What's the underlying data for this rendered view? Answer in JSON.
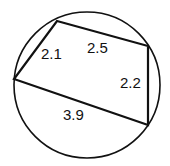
{
  "diagram": {
    "type": "cyclic-quadrilateral",
    "circle": {
      "cx": 87,
      "cy": 85,
      "r": 73
    },
    "vertices": [
      {
        "id": "A",
        "x": 57,
        "y": 21
      },
      {
        "id": "B",
        "x": 148,
        "y": 46
      },
      {
        "id": "C",
        "x": 148,
        "y": 125
      },
      {
        "id": "D",
        "x": 14,
        "y": 79
      }
    ],
    "sides": [
      {
        "from": "A",
        "to": "B",
        "length_label": "2.5",
        "label_x": 87,
        "label_y": 53
      },
      {
        "from": "B",
        "to": "C",
        "length_label": "2.2",
        "label_x": 120,
        "label_y": 88
      },
      {
        "from": "C",
        "to": "D",
        "length_label": "3.9",
        "label_x": 63,
        "label_y": 120
      },
      {
        "from": "D",
        "to": "A",
        "length_label": "2.1",
        "label_x": 41,
        "label_y": 59
      }
    ],
    "stroke_color": "#111111",
    "background": "#ffffff"
  }
}
